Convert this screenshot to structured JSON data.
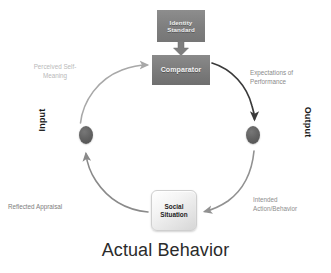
{
  "diagram": {
    "title": "Actual Behavior",
    "nodes": {
      "identity_standard": "Identity\nStandard",
      "comparator": "Comparator",
      "social_situation": "Social\nSituation",
      "input_node": "input-node",
      "output_node": "output-node"
    },
    "axis_labels": {
      "input": "Input",
      "output": "Output"
    },
    "edge_labels": {
      "perceived_self_meaning": "Perceived Self-\nMeaning",
      "expectations_of_performance": "Expectations of\nPerformance",
      "intended_action_behavior": "Intended\nAction/Behavior",
      "reflected_appraisal": "Reflected Appraisal"
    },
    "icons": {
      "down_block_arrow": "down-block-arrow-icon"
    },
    "colors": {
      "box_fill_dark": "#7c7c7c",
      "box_text_light": "#f0f0f0",
      "node_fill": "#636363",
      "arc_dark": "#3a3a3a",
      "arc_mid": "#8a8a8a",
      "arc_light": "#b5b5b5",
      "title_text": "#2b2b2b",
      "background": "#ffffff"
    }
  }
}
